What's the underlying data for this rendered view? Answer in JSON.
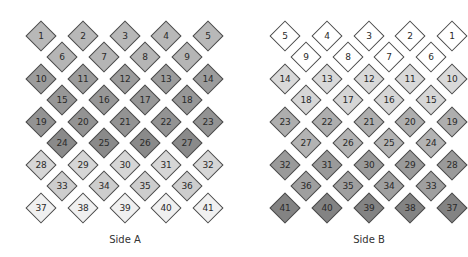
{
  "panels": [
    {
      "id": "side-a",
      "caption": "Side A",
      "caption_x": 125,
      "columns_x": [
        41,
        83,
        125,
        166,
        208
      ],
      "offset_columns_x": [
        62,
        104,
        145,
        187
      ],
      "rows": [
        {
          "y": 36,
          "type": "full",
          "labels": [
            "1",
            "2",
            "3",
            "4",
            "5"
          ],
          "fill": "#b8b8b8"
        },
        {
          "y": 57,
          "type": "offset",
          "labels": [
            "6",
            "7",
            "8",
            "9"
          ],
          "fill": "#b5b5b5"
        },
        {
          "y": 79,
          "type": "full",
          "labels": [
            "10",
            "11",
            "12",
            "13",
            "14"
          ],
          "fill": "#9c9c9c"
        },
        {
          "y": 100,
          "type": "offset",
          "labels": [
            "15",
            "16",
            "17",
            "18"
          ],
          "fill": "#979797"
        },
        {
          "y": 122,
          "type": "full",
          "labels": [
            "19",
            "20",
            "21",
            "22",
            "23"
          ],
          "fill": "#939393"
        },
        {
          "y": 143,
          "type": "offset",
          "labels": [
            "24",
            "25",
            "26",
            "27"
          ],
          "fill": "#8a8a8a"
        },
        {
          "y": 165,
          "type": "full",
          "labels": [
            "28",
            "29",
            "30",
            "31",
            "32"
          ],
          "fill": "#d6d6d6"
        },
        {
          "y": 186,
          "type": "offset",
          "labels": [
            "33",
            "34",
            "35",
            "36"
          ],
          "fill": "#cdcdcd"
        },
        {
          "y": 208,
          "type": "full",
          "labels": [
            "37",
            "38",
            "39",
            "40",
            "41"
          ],
          "fill": "#f0f0f0"
        }
      ]
    },
    {
      "id": "side-b",
      "caption": "Side B",
      "caption_x": 369,
      "columns_x": [
        285,
        327,
        369,
        410,
        452
      ],
      "offset_columns_x": [
        306,
        348,
        389,
        431
      ],
      "rows": [
        {
          "y": 36,
          "type": "full",
          "labels": [
            "5",
            "4",
            "3",
            "2",
            "1"
          ],
          "fill": "#ffffff"
        },
        {
          "y": 57,
          "type": "offset",
          "labels": [
            "9",
            "8",
            "7",
            "6"
          ],
          "fill": "#ffffff"
        },
        {
          "y": 79,
          "type": "full",
          "labels": [
            "14",
            "13",
            "12",
            "11",
            "10"
          ],
          "fill": "#d9d9d9"
        },
        {
          "y": 100,
          "type": "offset",
          "labels": [
            "18",
            "17",
            "16",
            "15"
          ],
          "fill": "#d6d6d6"
        },
        {
          "y": 122,
          "type": "full",
          "labels": [
            "23",
            "22",
            "21",
            "20",
            "19"
          ],
          "fill": "#aeaeae"
        },
        {
          "y": 143,
          "type": "offset",
          "labels": [
            "27",
            "26",
            "25",
            "24"
          ],
          "fill": "#b3b3b3"
        },
        {
          "y": 165,
          "type": "full",
          "labels": [
            "32",
            "31",
            "30",
            "29",
            "28"
          ],
          "fill": "#9a9a9a"
        },
        {
          "y": 186,
          "type": "offset",
          "labels": [
            "36",
            "35",
            "34",
            "33"
          ],
          "fill": "#9f9f9f"
        },
        {
          "y": 208,
          "type": "full",
          "labels": [
            "41",
            "40",
            "39",
            "38",
            "37"
          ],
          "fill": "#838383"
        }
      ]
    }
  ],
  "caption_y": 241,
  "stroke_color": "#4a4a4a",
  "text_color": "#2a2a2a"
}
